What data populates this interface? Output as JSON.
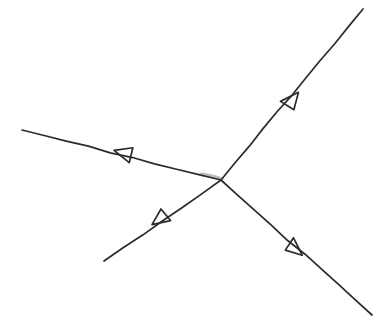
{
  "figure": {
    "kind": "hand-drawn-feynman-vertex-diagram",
    "width": 387,
    "height": 323,
    "background_color": "#ffffff",
    "ink_color": "#2b2b2b",
    "ink_color_light": "#4a4a4a",
    "vertex": {
      "name": "interaction-vertex",
      "x": 221,
      "y": 180
    }
  },
  "chart_data": {
    "type": "diagram",
    "xlabel": "",
    "ylabel": "",
    "grid": false,
    "legend": "none",
    "vertex": {
      "x": 221,
      "y": 180
    },
    "legs": [
      {
        "id": "upper-left-leg",
        "label": "",
        "from": {
          "x": 221,
          "y": 180
        },
        "to": {
          "x": 22,
          "y": 130
        },
        "direction": "outgoing",
        "arrow_at": {
          "x": 124,
          "y": 153
        },
        "arrow_angle_deg": 194,
        "stroke_width": 1.7
      },
      {
        "id": "upper-right-leg",
        "label": "",
        "from": {
          "x": 221,
          "y": 180
        },
        "to": {
          "x": 363,
          "y": 9
        },
        "direction": "outgoing",
        "arrow_at": {
          "x": 292,
          "y": 100
        },
        "arrow_angle_deg": 309.7,
        "stroke_width": 1.7
      },
      {
        "id": "lower-left-leg",
        "label": "",
        "from": {
          "x": 221,
          "y": 180
        },
        "to": {
          "x": 104,
          "y": 261
        },
        "direction": "outgoing",
        "arrow_at": {
          "x": 160,
          "y": 219
        },
        "arrow_angle_deg": 145.3,
        "stroke_width": 1.7
      },
      {
        "id": "lower-right-leg",
        "label": "",
        "from": {
          "x": 221,
          "y": 180
        },
        "to": {
          "x": 372,
          "y": 315
        },
        "direction": "outgoing",
        "arrow_at": {
          "x": 295,
          "y": 249
        },
        "arrow_angle_deg": 41.8,
        "stroke_width": 1.7
      }
    ],
    "arrowheads": [
      {
        "id": "arrowhead-upper-left",
        "x": 124,
        "y": 153,
        "angle_deg": 194,
        "style": "open-triangle",
        "size": 16
      },
      {
        "id": "arrowhead-upper-right",
        "x": 292,
        "y": 100,
        "angle_deg": 309.7,
        "style": "open-triangle",
        "size": 16
      },
      {
        "id": "arrowhead-lower-left",
        "x": 160,
        "y": 219,
        "angle_deg": 145.3,
        "style": "open-triangle",
        "size": 16
      },
      {
        "id": "arrowhead-lower-right",
        "x": 295,
        "y": 249,
        "angle_deg": 41.8,
        "style": "open-triangle",
        "size": 16
      }
    ],
    "annotations": []
  }
}
